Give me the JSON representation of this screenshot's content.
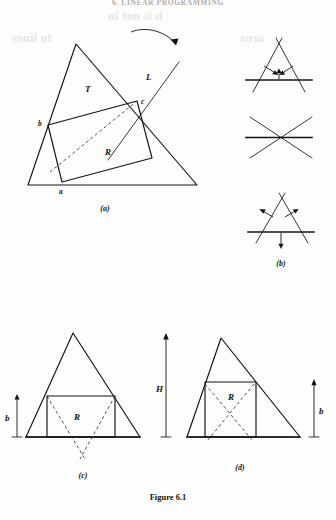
{
  "page": {
    "running_header": "6. LINEAR PROGRAMMING",
    "caption": "Figure 6.1",
    "background_color": "#fdfdfc",
    "ink_color": "#15130f"
  },
  "panels": {
    "a": {
      "key": "(a)",
      "labels": {
        "triangle": "T",
        "line": "L",
        "rect": "R",
        "point_a": "a",
        "point_b": "b",
        "point_c": "c"
      },
      "annotations": {
        "rotation_arrow": "curved-arrow-clockwise"
      }
    },
    "b": {
      "key": "(b)",
      "diagrams": [
        {
          "name": "arrows-inward",
          "arrows": [
            "in-left",
            "in-right",
            "up-center"
          ]
        },
        {
          "name": "degenerate-crossing",
          "arrows": []
        },
        {
          "name": "arrows-outward",
          "arrows": [
            "out-left",
            "out-right",
            "down-center"
          ]
        }
      ]
    },
    "c": {
      "key": "(c)",
      "labels": {
        "rect": "R",
        "height": "b"
      }
    },
    "d": {
      "key": "(d)",
      "labels": {
        "rect": "R",
        "height": "b"
      }
    },
    "H": {
      "label": "H"
    }
  },
  "bleed_text": [
    {
      "text": "h is not in",
      "x": 108,
      "y": 18,
      "size": 13
    },
    {
      "text": "to lines",
      "x": 12,
      "y": 40,
      "size": 13
    },
    {
      "text": "area",
      "x": 240,
      "y": 40,
      "size": 13
    }
  ]
}
